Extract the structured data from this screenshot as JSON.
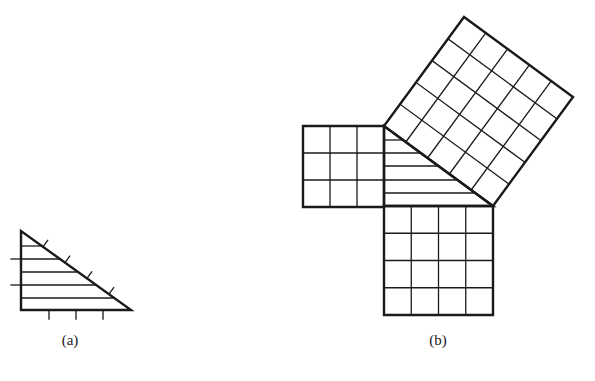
{
  "figure": {
    "colors": {
      "stroke": "#1a1a1a",
      "background": "#ffffff"
    },
    "panel_a": {
      "label": "(a)",
      "shape": "right-triangle",
      "vertices": [
        [
          21,
          231
        ],
        [
          21,
          310
        ],
        [
          131,
          310
        ]
      ],
      "hatch_lines_y": [
        246,
        259,
        272,
        285,
        298
      ],
      "left_ticks_y": [
        259,
        285
      ],
      "bottom_ticks_x": [
        49,
        76,
        103
      ],
      "hypotenuse_ticks": 4
    },
    "panel_b": {
      "label": "(b)",
      "legs": [
        3,
        4
      ],
      "hypotenuse": 5,
      "small_square": {
        "grid": 3,
        "x": 303,
        "y": 126,
        "size": 81
      },
      "bottom_square": {
        "grid": 4,
        "x": 384,
        "y": 206,
        "size": 109
      },
      "hyp_square": {
        "grid": 5,
        "corners": [
          [
            384,
            126
          ],
          [
            493,
            206
          ],
          [
            573,
            97
          ],
          [
            464,
            17
          ]
        ]
      },
      "triangle_vertices": [
        [
          384,
          126
        ],
        [
          384,
          206
        ],
        [
          493,
          206
        ]
      ],
      "hatch_lines_y": [
        140,
        153,
        166,
        180,
        193
      ]
    }
  }
}
